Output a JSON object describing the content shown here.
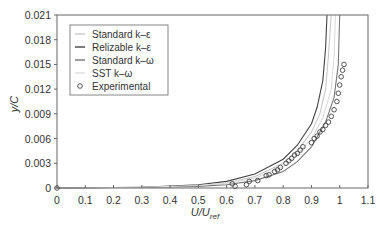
{
  "chart_data": {
    "type": "line",
    "title": "",
    "xlabel": "U/U_ref",
    "ylabel": "y/C",
    "xlim": [
      0,
      1.1
    ],
    "ylim": [
      0,
      0.021
    ],
    "xticks": [
      "0",
      "0.1",
      "0.2",
      "0.3",
      "0.4",
      "0.5",
      "0.6",
      "0.7",
      "0.8",
      "0.9",
      "1",
      "1.1"
    ],
    "yticks": [
      "0",
      "0.003",
      "0.006",
      "0.009",
      "0.012",
      "0.015",
      "0.018",
      "0.021"
    ],
    "grid": false,
    "legend_position": "upper left",
    "series": [
      {
        "name": "Standard k–ε",
        "color": "#c8c8c8",
        "x": [
          0,
          0.3,
          0.5,
          0.6,
          0.7,
          0.8,
          0.85,
          0.9,
          0.93,
          0.95,
          0.96,
          0.97
        ],
        "y": [
          0,
          0.0001,
          0.0003,
          0.0006,
          0.0014,
          0.003,
          0.0045,
          0.0068,
          0.009,
          0.012,
          0.016,
          0.021
        ]
      },
      {
        "name": "Relizable k–ε",
        "color": "#444444",
        "x": [
          0,
          0.3,
          0.5,
          0.6,
          0.7,
          0.8,
          0.85,
          0.9,
          0.92,
          0.94,
          0.95,
          0.955
        ],
        "y": [
          0,
          0.0001,
          0.0004,
          0.0008,
          0.0017,
          0.0035,
          0.0052,
          0.0078,
          0.0098,
          0.013,
          0.017,
          0.021
        ]
      },
      {
        "name": "Standard k–ω",
        "color": "#777777",
        "x": [
          0,
          0.3,
          0.5,
          0.6,
          0.7,
          0.8,
          0.85,
          0.9,
          0.95,
          0.98,
          0.995,
          1.0
        ],
        "y": [
          0,
          0.0001,
          0.0002,
          0.0004,
          0.0009,
          0.002,
          0.0032,
          0.005,
          0.008,
          0.011,
          0.015,
          0.021
        ]
      },
      {
        "name": "SST k–ω",
        "color": "#dddddd",
        "x": [
          0,
          0.3,
          0.5,
          0.6,
          0.7,
          0.8,
          0.85,
          0.9,
          0.94,
          0.97,
          0.98,
          0.985
        ],
        "y": [
          0,
          0.0001,
          0.0003,
          0.0006,
          0.0012,
          0.0026,
          0.004,
          0.006,
          0.0085,
          0.012,
          0.016,
          0.021
        ]
      },
      {
        "name": "Experimental",
        "marker": "circle",
        "x": [
          0,
          0.62,
          0.63,
          0.67,
          0.68,
          0.71,
          0.74,
          0.75,
          0.77,
          0.78,
          0.79,
          0.81,
          0.82,
          0.83,
          0.84,
          0.85,
          0.86,
          0.87,
          0.9,
          0.91,
          0.92,
          0.93,
          0.94,
          0.95,
          0.96,
          0.97,
          0.98,
          0.99,
          0.995,
          1.0,
          1.005,
          1.01,
          1.015
        ],
        "y": [
          0,
          0.0005,
          0.0002,
          0.0004,
          0.0008,
          0.0009,
          0.0015,
          0.0016,
          0.002,
          0.0022,
          0.0025,
          0.003,
          0.0033,
          0.0036,
          0.004,
          0.0042,
          0.0046,
          0.005,
          0.0055,
          0.006,
          0.0063,
          0.0068,
          0.0071,
          0.0076,
          0.008,
          0.0087,
          0.0095,
          0.0105,
          0.0115,
          0.0125,
          0.0135,
          0.0143,
          0.015
        ]
      }
    ]
  },
  "legend": {
    "items": [
      {
        "label": "Standard k–ε",
        "color": "#c8c8c8"
      },
      {
        "label": "Relizable k–ε",
        "color": "#444444"
      },
      {
        "label": "Standard k–ω",
        "color": "#777777"
      },
      {
        "label": "SST k–ω",
        "color": "#dddddd"
      },
      {
        "label": "Experimental",
        "color": "#444444"
      }
    ]
  },
  "axes": {
    "xlabel_main": "U/U",
    "xlabel_sub": "ref",
    "ylabel": "y/C"
  }
}
